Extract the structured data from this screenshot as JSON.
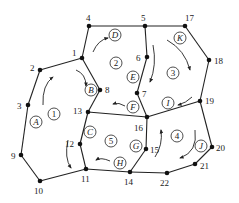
{
  "diagram": {
    "type": "network-graph",
    "colors": {
      "stroke": "#222222",
      "node": "#111111",
      "background": "#ffffff"
    },
    "nodes": [
      {
        "id": "1",
        "x": 82,
        "y": 58,
        "lx": 72,
        "ly": 56
      },
      {
        "id": "2",
        "x": 40,
        "y": 70,
        "lx": 30,
        "ly": 71
      },
      {
        "id": "3",
        "x": 28,
        "y": 105,
        "lx": 17,
        "ly": 109
      },
      {
        "id": "4",
        "x": 89,
        "y": 26,
        "lx": 86,
        "ly": 21
      },
      {
        "id": "5",
        "x": 145,
        "y": 26,
        "lx": 141,
        "ly": 21
      },
      {
        "id": "6",
        "x": 147,
        "y": 57,
        "lx": 136,
        "ly": 61
      },
      {
        "id": "7",
        "x": 137,
        "y": 93,
        "lx": 142,
        "ly": 97
      },
      {
        "id": "8",
        "x": 100,
        "y": 90,
        "lx": 105,
        "ly": 93
      },
      {
        "id": "9",
        "x": 21,
        "y": 155,
        "lx": 11,
        "ly": 159
      },
      {
        "id": "10",
        "x": 40,
        "y": 181,
        "lx": 34,
        "ly": 194
      },
      {
        "id": "11",
        "x": 86,
        "y": 169,
        "lx": 81,
        "ly": 182
      },
      {
        "id": "12",
        "x": 80,
        "y": 144,
        "lx": 65,
        "ly": 147
      },
      {
        "id": "13",
        "x": 88,
        "y": 112,
        "lx": 73,
        "ly": 114
      },
      {
        "id": "14",
        "x": 130,
        "y": 172,
        "lx": 124,
        "ly": 185
      },
      {
        "id": "15",
        "x": 146,
        "y": 149,
        "lx": 150,
        "ly": 153
      },
      {
        "id": "16",
        "x": 147,
        "y": 117,
        "lx": 134,
        "ly": 131
      },
      {
        "id": "17",
        "x": 185,
        "y": 26,
        "lx": 185,
        "ly": 21
      },
      {
        "id": "18",
        "x": 209,
        "y": 60,
        "lx": 214,
        "ly": 64
      },
      {
        "id": "19",
        "x": 200,
        "y": 101,
        "lx": 205,
        "ly": 104
      },
      {
        "id": "20",
        "x": 212,
        "y": 147,
        "lx": 216,
        "ly": 151
      },
      {
        "id": "21",
        "x": 195,
        "y": 164,
        "lx": 200,
        "ly": 169
      },
      {
        "id": "22",
        "x": 167,
        "y": 173,
        "lx": 160,
        "ly": 186
      }
    ],
    "edges": [
      [
        "1",
        "2"
      ],
      [
        "2",
        "3"
      ],
      [
        "3",
        "9"
      ],
      [
        "9",
        "10"
      ],
      [
        "10",
        "11"
      ],
      [
        "11",
        "12"
      ],
      [
        "12",
        "13"
      ],
      [
        "13",
        "8"
      ],
      [
        "8",
        "1"
      ],
      [
        "1",
        "4"
      ],
      [
        "4",
        "5"
      ],
      [
        "5",
        "17"
      ],
      [
        "5",
        "6"
      ],
      [
        "6",
        "7"
      ],
      [
        "7",
        "16"
      ],
      [
        "13",
        "16"
      ],
      [
        "17",
        "18"
      ],
      [
        "18",
        "19"
      ],
      [
        "19",
        "16"
      ],
      [
        "16",
        "15"
      ],
      [
        "15",
        "14"
      ],
      [
        "11",
        "14"
      ],
      [
        "14",
        "22"
      ],
      [
        "22",
        "21"
      ],
      [
        "21",
        "20"
      ],
      [
        "20",
        "19"
      ]
    ],
    "region_labels": [
      {
        "text": "1",
        "x": 54,
        "y": 114
      },
      {
        "text": "2",
        "x": 116,
        "y": 63
      },
      {
        "text": "3",
        "x": 173,
        "y": 73
      },
      {
        "text": "4",
        "x": 177,
        "y": 136
      },
      {
        "text": "5",
        "x": 111,
        "y": 141
      }
    ],
    "link_labels": [
      {
        "text": "A",
        "x": 36,
        "y": 122
      },
      {
        "text": "B",
        "x": 91,
        "y": 90
      },
      {
        "text": "C",
        "x": 90,
        "y": 132
      },
      {
        "text": "D",
        "x": 115,
        "y": 35
      },
      {
        "text": "E",
        "x": 133,
        "y": 77
      },
      {
        "text": "F",
        "x": 133,
        "y": 107
      },
      {
        "text": "G",
        "x": 136,
        "y": 146
      },
      {
        "text": "H",
        "x": 120,
        "y": 163
      },
      {
        "text": "I",
        "x": 168,
        "y": 103
      },
      {
        "text": "J",
        "x": 201,
        "y": 146
      },
      {
        "text": "K",
        "x": 180,
        "y": 38
      }
    ],
    "arrows": [
      {
        "d": "M43,105 Q42,85 53,77",
        "name": "arrow-A"
      },
      {
        "d": "M76,70 Q86,74 86,86",
        "name": "arrow-B"
      },
      {
        "d": "M68,140 Q64,158 71,168",
        "name": "arrow-C"
      },
      {
        "d": "M93,52 Q98,40 108,38",
        "name": "arrow-D"
      },
      {
        "d": "M153,45 Q157,65 150,82",
        "name": "arrow-E"
      },
      {
        "d": "M125,106 Q119,102 113,104",
        "name": "arrow-F"
      },
      {
        "d": "M155,157 Q163,145 161,130",
        "name": "arrow-15"
      },
      {
        "d": "M110,161 Q101,157 96,160",
        "name": "arrow-H"
      },
      {
        "d": "M192,97 Q186,103 178,105",
        "name": "arrow-I"
      },
      {
        "d": "M195,130 Q198,152 180,158",
        "name": "arrow-J"
      },
      {
        "d": "M167,40 Q185,50 190,70",
        "name": "arrow-K"
      }
    ]
  }
}
